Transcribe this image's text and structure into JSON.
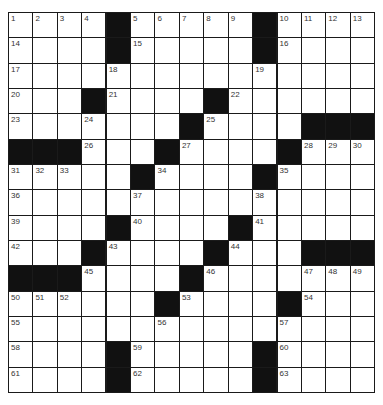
{
  "puzzle": {
    "rows": 15,
    "cols": 15,
    "grid": [
      ".....#.....#....",
      "x"
    ],
    "layout": [
      "1,2,3,4,#,5,6,7,8,9,#,10,11,12,13",
      "14,_,_,_,#,15,_,_,_,_,#,16,_,_,_",
      "17,_,_,_,18,_,_,_,_,_,19,_,_,_,_",
      "20,_,_,#,21,_,_,_,#,22,_,_,_,_,_",
      "23,_,_,24,_,_,_,#,25,_,_,_,#,#,#",
      "#,#,#,26,_,_,#,27,_,_,_,#,28,29,30",
      "31,32,33,_,_,#,34,_,_,_,#,35,_,_,_",
      "36,_,_,_,_,37,_,_,_,_,38,_,_,_,_",
      "39,_,_,_,#,40,_,_,_,#,41,_,_,_,_",
      "42,_,_,#,43,_,_,_,#,44,_,_,#,#,#",
      "#,#,#,45,_,_,_,#,46,_,_,_,47,48,49",
      "50,51,52,_,_,_,#,53,_,_,_,#,54,_,_",
      "55,_,_,_,_,_,56,_,_,_,_,57,_,_,_",
      "58,_,_,_,#,59,_,_,_,_,#,60,_,_,_",
      "61,_,_,_,#,62,_,_,_,_,#,63,_,_,_"
    ],
    "colors": {
      "black_cell": "#111111",
      "white_cell": "#ffffff",
      "grid_line": "#1a1a1a",
      "number_text": "#333333"
    }
  }
}
